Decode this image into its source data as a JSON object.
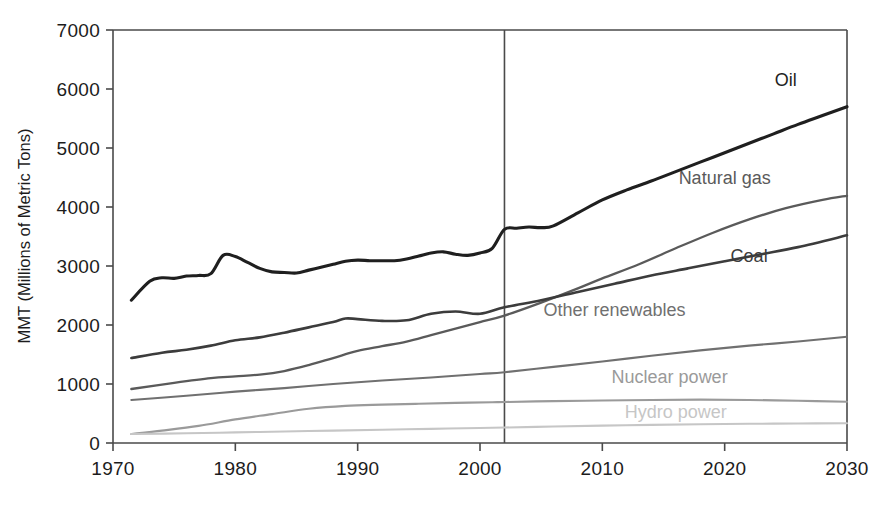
{
  "chart_data": {
    "type": "line",
    "title": "",
    "xlabel": "",
    "ylabel": "MMT (Millions of Metric Tons)",
    "xlim": [
      1970,
      2030
    ],
    "ylim": [
      0,
      7000
    ],
    "grid": false,
    "legend_position": "inline-right-labels",
    "x_ticks": [
      "1970",
      "1980",
      "1990",
      "2000",
      "2010",
      "2020",
      "2030"
    ],
    "x_tick_values": [
      1970,
      1980,
      1990,
      2000,
      2010,
      2020,
      2030
    ],
    "y_ticks": [
      "0",
      "1000",
      "2000",
      "3000",
      "4000",
      "5000",
      "6000",
      "7000"
    ],
    "y_tick_values": [
      0,
      1000,
      2000,
      3000,
      4000,
      5000,
      6000,
      7000
    ],
    "annotations": [
      {
        "name": "history-projection-divider",
        "type": "vertical-line",
        "x": 2002,
        "label": ""
      }
    ],
    "series": [
      {
        "name": "Oil",
        "label": "Oil",
        "color": "#1f1f1f",
        "width": 3.1,
        "label_x": 2025.0,
        "label_y": 6050,
        "label_anchor": "middle",
        "x": [
          1971.5,
          1973,
          1974,
          1975,
          1976,
          1977,
          1978,
          1979,
          1980,
          1981,
          1982,
          1983,
          1984,
          1985,
          1986,
          1987,
          1988,
          1989,
          1990,
          1991,
          1992,
          1993,
          1994,
          1995,
          1996,
          1997,
          1998,
          1999,
          2000,
          2001,
          2002,
          2003,
          2004,
          2005,
          2006,
          2008,
          2010,
          2012,
          2014,
          2016,
          2018,
          2020,
          2022,
          2024,
          2026,
          2028,
          2030
        ],
        "y": [
          2420,
          2740,
          2800,
          2790,
          2830,
          2840,
          2870,
          3180,
          3160,
          3060,
          2960,
          2900,
          2890,
          2880,
          2930,
          2980,
          3030,
          3080,
          3100,
          3090,
          3090,
          3090,
          3120,
          3170,
          3220,
          3240,
          3200,
          3180,
          3220,
          3300,
          3620,
          3640,
          3660,
          3650,
          3680,
          3900,
          4120,
          4290,
          4440,
          4600,
          4760,
          4920,
          5080,
          5240,
          5400,
          5550,
          5700
        ]
      },
      {
        "name": "Natural gas",
        "label": "Natural gas",
        "color": "#5a5a5a",
        "width": 2.3,
        "label_x": 2020.0,
        "label_y": 4390,
        "label_anchor": "middle",
        "x": [
          1971.5,
          1975,
          1978,
          1980,
          1982,
          1984,
          1986,
          1988,
          1990,
          1992,
          1994,
          1996,
          1998,
          2000,
          2002,
          2005,
          2008,
          2010,
          2013,
          2016,
          2019,
          2022,
          2025,
          2028,
          2030
        ],
        "y": [
          915,
          1020,
          1100,
          1130,
          1160,
          1220,
          1320,
          1440,
          1560,
          1640,
          1720,
          1830,
          1940,
          2050,
          2160,
          2380,
          2620,
          2790,
          3030,
          3300,
          3560,
          3790,
          3980,
          4120,
          4190
        ]
      },
      {
        "name": "Coal",
        "label": "Coal",
        "color": "#3c3c3c",
        "width": 2.6,
        "label_x": 2022.0,
        "label_y": 3070,
        "label_anchor": "middle",
        "x": [
          1971.5,
          1974,
          1976,
          1978,
          1980,
          1982,
          1984,
          1986,
          1988,
          1989,
          1990,
          1992,
          1994,
          1996,
          1998,
          2000,
          2002,
          2005,
          2008,
          2011,
          2014,
          2017,
          2020,
          2023,
          2026,
          2030
        ],
        "y": [
          1440,
          1530,
          1580,
          1650,
          1740,
          1790,
          1870,
          1960,
          2050,
          2110,
          2100,
          2070,
          2080,
          2190,
          2230,
          2190,
          2300,
          2420,
          2560,
          2700,
          2840,
          2960,
          3080,
          3200,
          3320,
          3520
        ]
      },
      {
        "name": "Other renewables",
        "label": "Other renewables",
        "color": "#707070",
        "width": 2.1,
        "label_x": 2011.0,
        "label_y": 2160,
        "label_anchor": "middle",
        "x": [
          1971.5,
          1976,
          1980,
          1984,
          1988,
          1992,
          1996,
          2000,
          2002,
          2006,
          2010,
          2014,
          2018,
          2022,
          2026,
          2030
        ],
        "y": [
          730,
          800,
          870,
          930,
          1000,
          1060,
          1110,
          1170,
          1200,
          1290,
          1380,
          1480,
          1570,
          1650,
          1720,
          1800
        ]
      },
      {
        "name": "Nuclear power",
        "label": "Nuclear power",
        "color": "#9a9a9a",
        "width": 2.1,
        "label_x": 2015.5,
        "label_y": 1020,
        "label_anchor": "middle",
        "x": [
          1971.5,
          1974,
          1977,
          1980,
          1983,
          1986,
          1989,
          1992,
          1995,
          1998,
          2001,
          2002,
          2006,
          2010,
          2014,
          2018,
          2022,
          2026,
          2030
        ],
        "y": [
          152,
          210,
          290,
          400,
          490,
          580,
          630,
          650,
          665,
          680,
          690,
          695,
          710,
          720,
          730,
          735,
          730,
          715,
          700
        ]
      },
      {
        "name": "Hydro power",
        "label": "Hydro power",
        "color": "#c6c6c6",
        "width": 2.1,
        "label_x": 2016.0,
        "label_y": 420,
        "label_anchor": "middle",
        "x": [
          1971.5,
          1976,
          1980,
          1984,
          1988,
          1992,
          1996,
          2000,
          2002,
          2006,
          2010,
          2014,
          2018,
          2022,
          2026,
          2030
        ],
        "y": [
          152,
          165,
          180,
          195,
          210,
          225,
          240,
          255,
          262,
          280,
          295,
          308,
          318,
          325,
          330,
          335
        ]
      }
    ]
  }
}
